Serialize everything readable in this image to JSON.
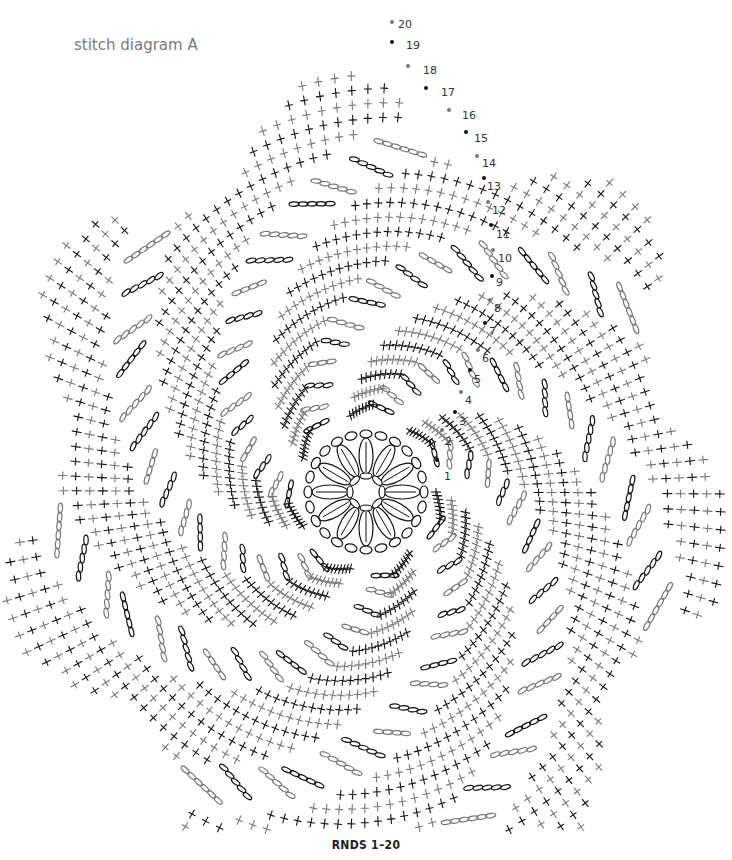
{
  "title": "stitch diagram A",
  "caption": "RNDS 1–20",
  "colors": {
    "dark_round": "#111111",
    "light_round": "#777777",
    "label": "#333333",
    "background": "#ffffff"
  },
  "legend_rounds": {
    "count": 20,
    "labels": [
      "1",
      "2",
      "3",
      "4",
      "5",
      "6",
      "7",
      "8",
      "9",
      "10",
      "11",
      "12",
      "13",
      "14",
      "15",
      "16",
      "17",
      "18",
      "19",
      "20"
    ],
    "positions": [
      [
        444,
        480
      ],
      [
        445,
        445
      ],
      [
        459,
        425
      ],
      [
        465,
        404
      ],
      [
        474,
        383
      ],
      [
        482,
        362
      ],
      [
        489,
        335
      ],
      [
        494,
        312
      ],
      [
        496,
        286
      ],
      [
        498,
        262
      ],
      [
        496,
        238
      ],
      [
        492,
        214
      ],
      [
        487,
        190
      ],
      [
        482,
        167
      ],
      [
        474,
        142
      ],
      [
        462,
        119
      ],
      [
        441,
        96
      ],
      [
        423,
        74
      ],
      [
        406,
        49
      ],
      [
        398,
        28
      ]
    ],
    "markers": [
      [
        437,
        460
      ],
      [
        442,
        430
      ],
      [
        455,
        412
      ],
      [
        461,
        392
      ],
      [
        470,
        370
      ],
      [
        478,
        350
      ],
      [
        485,
        323
      ],
      [
        490,
        300
      ],
      [
        492,
        276
      ],
      [
        493,
        250
      ],
      [
        491,
        225
      ],
      [
        488,
        202
      ],
      [
        484,
        178
      ],
      [
        477,
        156
      ],
      [
        466,
        132
      ],
      [
        449,
        110
      ],
      [
        426,
        88
      ],
      [
        408,
        66
      ],
      [
        392,
        42
      ],
      [
        392,
        22
      ]
    ]
  },
  "center": {
    "x": 366,
    "y": 492,
    "petals": 12,
    "inner_radius": 16,
    "outer_radius": 52
  },
  "spiral": {
    "arms": 7,
    "rounds": 20,
    "notes": "Alternating black/grey rounds of chain loops and single crochet crosses spiraling outward from central 12-petal motif"
  }
}
